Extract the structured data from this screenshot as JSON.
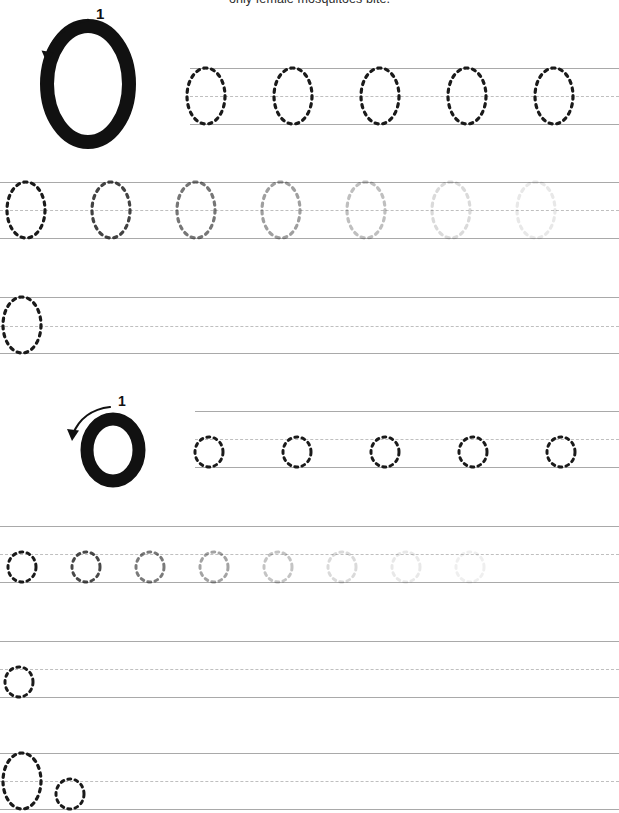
{
  "page": {
    "width": 619,
    "height": 813,
    "background_color": "#ffffff",
    "caption": "only female mosquitoes bite."
  },
  "colors": {
    "ink": "#1a1a1a",
    "guide_solid": "#a9a9a9",
    "guide_dashed": "#bfbfbf",
    "model_letter": "#111111",
    "arrow": "#111111",
    "stroke_number": "#111111"
  },
  "sections": [
    {
      "id": "uppercase",
      "letter": "O",
      "case": "uppercase",
      "model": {
        "glyph": "O",
        "stroke_number": "1",
        "arrow_direction": "counter-clockwise",
        "arrow_start": "top-right",
        "arrow_end": "upper-left"
      },
      "rows": [
        {
          "id": "upper-row-1",
          "type": "trace",
          "line_start_x": 190,
          "glyph_count": 5,
          "opacities": [
            1,
            1,
            1,
            1,
            1
          ]
        },
        {
          "id": "upper-row-2",
          "type": "trace-fading",
          "line_start_x": 0,
          "glyph_count": 7,
          "opacities": [
            1,
            0.82,
            0.6,
            0.42,
            0.28,
            0.16,
            0.1
          ]
        },
        {
          "id": "upper-row-3",
          "type": "practice",
          "line_start_x": 0,
          "glyph_count": 1,
          "opacities": [
            1
          ]
        }
      ]
    },
    {
      "id": "lowercase",
      "letter": "o",
      "case": "lowercase",
      "model": {
        "glyph": "o",
        "stroke_number": "1",
        "arrow_direction": "counter-clockwise",
        "arrow_start": "top-right",
        "arrow_end": "upper-left"
      },
      "rows": [
        {
          "id": "lower-row-1",
          "type": "trace",
          "line_start_x": 195,
          "glyph_count": 5,
          "opacities": [
            1,
            1,
            1,
            1,
            1
          ]
        },
        {
          "id": "lower-row-2",
          "type": "trace-fading",
          "line_start_x": 0,
          "glyph_count": 8,
          "opacities": [
            1,
            0.8,
            0.58,
            0.4,
            0.26,
            0.16,
            0.1,
            0.07
          ]
        },
        {
          "id": "lower-row-3",
          "type": "practice",
          "line_start_x": 0,
          "glyph_count": 1,
          "opacities": [
            1
          ]
        },
        {
          "id": "lower-row-4",
          "type": "practice-mixed",
          "line_start_x": 0,
          "glyph_count": 2,
          "opacities": [
            1,
            1
          ]
        }
      ]
    }
  ]
}
